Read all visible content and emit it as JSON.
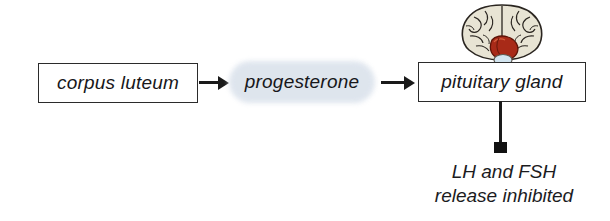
{
  "diagram": {
    "background_color": "#ffffff"
  },
  "nodes": {
    "corpus_luteum": {
      "label": "corpus luteum",
      "shape": "rectangle",
      "fill": "#ffffff",
      "border_color": "#2b2b2b"
    },
    "progesterone": {
      "label": "progesterone",
      "shape": "rounded-pill",
      "fill": "#dde4ed"
    },
    "pituitary_gland": {
      "label": "pituitary gland",
      "shape": "rectangle",
      "fill": "#ffffff",
      "border_color": "#2b2b2b"
    }
  },
  "connectors": {
    "luteum_to_progesterone": {
      "type": "arrow",
      "direction": "right",
      "color": "#1a1a1a"
    },
    "progesterone_to_pituitary": {
      "type": "arrow",
      "direction": "right",
      "color": "#1a1a1a"
    },
    "pituitary_to_caption": {
      "type": "line-with-square-terminator",
      "direction": "down",
      "color": "#111111"
    }
  },
  "caption": {
    "line1": "LH and FSH",
    "line2": "release inhibited"
  },
  "illustration": {
    "name": "brain-illustration",
    "description": "inferior view of brain with pituitary gland highlighted",
    "colors": {
      "cerebrum": "#e6e2d2",
      "outline": "#2a2520",
      "brainstem_red": "#a82a18",
      "pituitary": "#cfe3ee"
    }
  }
}
